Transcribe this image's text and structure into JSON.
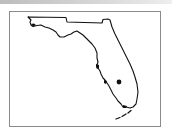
{
  "map": {
    "region": "Florida",
    "type": "state-outline",
    "frame": {
      "border_color": "#8a8a8a"
    },
    "outline_color": "#111111",
    "marker": {
      "label": "location-marker",
      "x": 119,
      "y": 82,
      "radius": 2.4,
      "color": "#111111"
    }
  }
}
